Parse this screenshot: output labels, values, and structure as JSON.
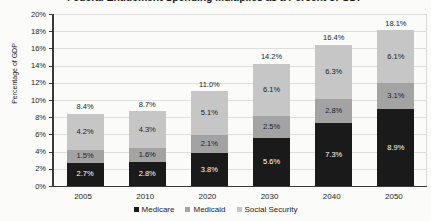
{
  "chart_data": {
    "type": "bar",
    "subtype": "stacked-column",
    "title": "Federal Entitlement Spending Multiplies as a Percent of GDP",
    "xlabel": "",
    "ylabel": "Percentage of GDP",
    "categories": [
      "2005",
      "2010",
      "2020",
      "2030",
      "2040",
      "2050"
    ],
    "ylim": [
      0,
      20
    ],
    "ytick_labels": [
      "0%",
      "2%",
      "4%",
      "6%",
      "8%",
      "10%",
      "12%",
      "14%",
      "16%",
      "18%",
      "20%"
    ],
    "ytick_values": [
      0,
      2,
      4,
      6,
      8,
      10,
      12,
      14,
      16,
      18,
      20
    ],
    "grid": true,
    "legend_position": "bottom",
    "series": [
      {
        "name": "Medicare",
        "color": "#1a1a1a",
        "label_color": "#ffffff",
        "values": [
          2.7,
          2.8,
          3.8,
          5.6,
          7.3,
          8.9
        ],
        "labels": [
          "2.7%",
          "2.8%",
          "3.8%",
          "5.6%",
          "7.3%",
          "8.9%"
        ]
      },
      {
        "name": "Medicaid",
        "color": "#a3a3a3",
        "label_color": "#1b1b1b",
        "values": [
          1.5,
          1.6,
          2.1,
          2.5,
          2.8,
          3.1
        ],
        "labels": [
          "1.5%",
          "1.6%",
          "2.1%",
          "2.5%",
          "2.8%",
          "3.1%"
        ]
      },
      {
        "name": "Social Security",
        "color": "#c6c6c6",
        "label_color": "#1b1b1b",
        "values": [
          4.2,
          4.3,
          5.1,
          6.1,
          6.3,
          6.1
        ],
        "labels": [
          "4.2%",
          "4.3%",
          "5.1%",
          "6.1%",
          "6.3%",
          "6.1%"
        ]
      }
    ],
    "totals": [
      8.4,
      8.7,
      11.0,
      14.2,
      16.4,
      18.1
    ],
    "total_labels": [
      "8.4%",
      "8.7%",
      "11.0%",
      "14.2%",
      "16.4%",
      "18.1%"
    ]
  }
}
